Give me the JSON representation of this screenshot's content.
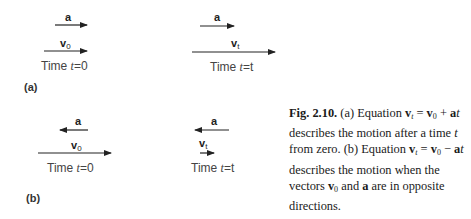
{
  "figure": {
    "panels": [
      {
        "label": "(a)",
        "states": [
          {
            "acceleration_label": "a",
            "acceleration_direction": "right",
            "velocity_label": "v",
            "velocity_subscript": "0",
            "velocity_direction": "right",
            "time_prefix": "Time ",
            "time_var": "t",
            "time_value": "=0"
          },
          {
            "acceleration_label": "a",
            "acceleration_direction": "right",
            "velocity_label": "v",
            "velocity_subscript": "t",
            "velocity_direction": "right",
            "time_prefix": "Time ",
            "time_var": "t",
            "time_value": "=t"
          }
        ]
      },
      {
        "label": "(b)",
        "states": [
          {
            "acceleration_label": "a",
            "acceleration_direction": "left",
            "velocity_label": "v",
            "velocity_subscript": "0",
            "velocity_direction": "right",
            "time_prefix": "Time ",
            "time_var": "t",
            "time_value": "=0"
          },
          {
            "acceleration_label": "a",
            "acceleration_direction": "left",
            "velocity_label": "v",
            "velocity_subscript": "t",
            "velocity_direction": "right",
            "time_prefix": "Time ",
            "time_var": "t",
            "time_value": "=t"
          }
        ]
      }
    ],
    "caption": {
      "fig_label": "Fig. 2.10.",
      "part_a": " (a) Equation ",
      "eq_a_lhs_v": "v",
      "eq_a_lhs_sub": "t",
      "eq_a_eq": " = ",
      "eq_a_v": "v",
      "eq_a_v_sub": "0",
      "eq_a_plus": " + ",
      "eq_a_a": "a",
      "eq_a_t": "t",
      "part_a_rest": " describes the motion after a time ",
      "part_a_t": "t",
      "part_a_end": " from zero. (b) Equation ",
      "eq_b_lhs_v": "v",
      "eq_b_lhs_sub": "t",
      "eq_b_eq": " = ",
      "eq_b_v": "v",
      "eq_b_v_sub": "0",
      "eq_b_minus": " − ",
      "eq_b_a": "a",
      "eq_b_t": "t",
      "part_b_rest": " describes the motion when the vectors ",
      "vec_v": "v",
      "vec_v_sub": "0",
      "and_text": " and ",
      "vec_a": "a",
      "part_b_end": " are in opposite directions."
    }
  }
}
